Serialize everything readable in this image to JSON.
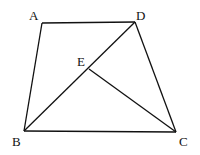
{
  "diagram": {
    "type": "geometry",
    "points": {
      "A": {
        "label": "A",
        "x": 42,
        "y": 23,
        "lx": 33,
        "ly": 19
      },
      "D": {
        "label": "D",
        "x": 135,
        "y": 22,
        "lx": 137,
        "ly": 19
      },
      "E": {
        "label": "E",
        "x": 89,
        "y": 69,
        "lx": 78,
        "ly": 66
      },
      "B": {
        "label": "B",
        "x": 24,
        "y": 131,
        "lx": 13,
        "ly": 145
      },
      "C": {
        "label": "C",
        "x": 176,
        "y": 132,
        "lx": 180,
        "ly": 145
      }
    },
    "segments": [
      [
        "A",
        "D"
      ],
      [
        "A",
        "B"
      ],
      [
        "B",
        "C"
      ],
      [
        "D",
        "C"
      ],
      [
        "B",
        "D"
      ],
      [
        "E",
        "C"
      ]
    ],
    "color": "#111111"
  }
}
